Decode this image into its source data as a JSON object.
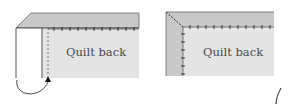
{
  "diagram": {
    "left_panel": {
      "label": "Quilt back",
      "step": "fold binding up and over, aligning with quilt edge"
    },
    "right_panel": {
      "label": "Quilt back",
      "step": "mitered corner stitched"
    },
    "colors": {
      "binding": "#c8c8c8",
      "quilt_back": "#e4e4e4",
      "outline": "#555555",
      "stitch": "#222222"
    }
  }
}
